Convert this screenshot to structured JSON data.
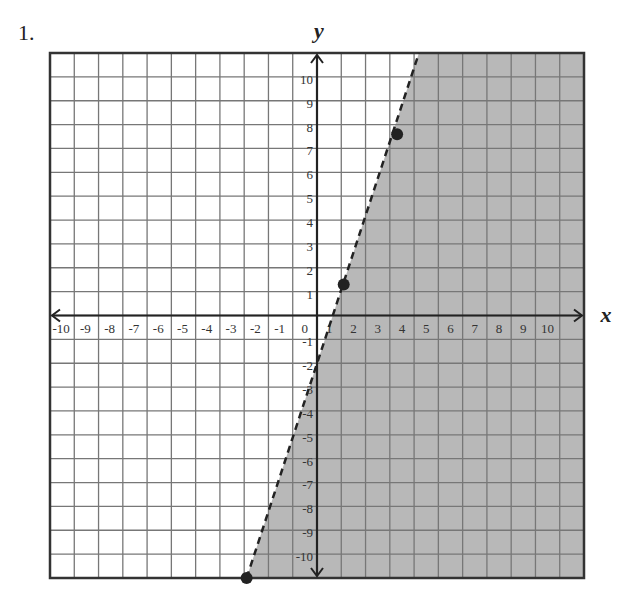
{
  "problem": {
    "number": "1."
  },
  "chart_data": {
    "type": "line",
    "title": "",
    "xlabel": "x",
    "ylabel": "y",
    "xlim": [
      -11,
      11
    ],
    "ylim": [
      -11,
      11
    ],
    "grid": true,
    "x_ticks": [
      "-10",
      "-9",
      "-8",
      "-7",
      "-6",
      "-5",
      "-4",
      "-3",
      "-2",
      "-1",
      "0",
      "1",
      "2",
      "3",
      "4",
      "5",
      "6",
      "7",
      "8",
      "9",
      "10"
    ],
    "y_ticks": [
      "10",
      "9",
      "8",
      "7",
      "6",
      "5",
      "4",
      "3",
      "2",
      "1",
      "-1",
      "-2",
      "-3",
      "-4",
      "-5",
      "-6",
      "-7",
      "-8",
      "-9",
      "-10"
    ],
    "boundary_line": {
      "style": "dashed",
      "equation_estimate": "y = 3.25x - 2",
      "from": [
        -2.9,
        -11
      ],
      "to": [
        4.2,
        11
      ]
    },
    "points": [
      {
        "x": 3.3,
        "y": 7.6
      },
      {
        "x": 1.1,
        "y": 1.3
      },
      {
        "x": -2.9,
        "y": -11
      }
    ],
    "shaded_region": "right of line (y < boundary)",
    "shade_color": "#b8b8b8"
  }
}
